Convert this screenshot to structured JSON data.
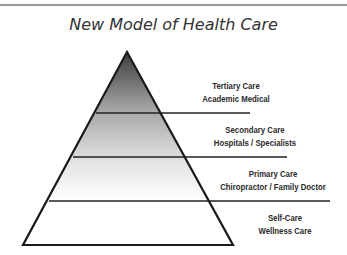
{
  "title": "New Model of Health Care",
  "colors": {
    "outline": "#1a1a1a",
    "gradient_top": "#4a4a4a",
    "gradient_mid": "#b8b8b8",
    "gradient_bottom": "#ffffff",
    "rule": "#9a9a9a"
  },
  "tiers": [
    {
      "line1": "Tertiary Care",
      "line2": "Academic Medical"
    },
    {
      "line1": "Secondary Care",
      "line2": "Hospitals / Specialists"
    },
    {
      "line1": "Primary Care",
      "line2": "Chiropractor / Family Doctor"
    },
    {
      "line1": "Self-Care",
      "line2": "Wellness Care"
    }
  ]
}
